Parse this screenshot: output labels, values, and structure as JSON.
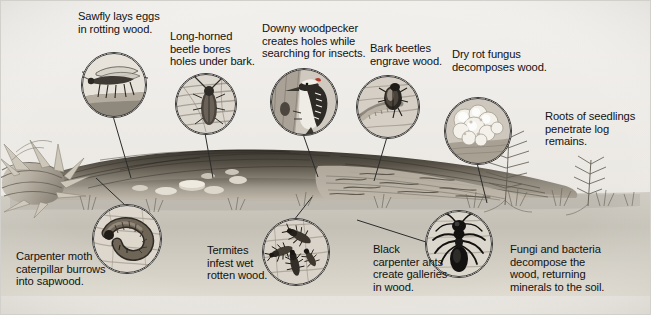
{
  "figure": {
    "background_color": "#f3f3f1",
    "border_color": "#cfcfcb",
    "text_color": "#121212",
    "width": 651,
    "height": 315
  },
  "labels": [
    {
      "id": "sawfly",
      "text": "Sawfly lays eggs\nin rotting wood.",
      "x": 78,
      "y": 10
    },
    {
      "id": "longhorn",
      "text": "Long-horned\nbeetle bores\nholes under bark.",
      "x": 170,
      "y": 30
    },
    {
      "id": "woodpecker",
      "text": "Downy woodpecker\ncreates holes while\nsearching for insects.",
      "x": 262,
      "y": 22
    },
    {
      "id": "barkbeetle",
      "text": "Bark beetles\nengrave wood.",
      "x": 370,
      "y": 42
    },
    {
      "id": "dryrot",
      "text": "Dry rot fungus\ndecomposes wood.",
      "x": 452,
      "y": 48
    },
    {
      "id": "roots",
      "text": "Roots of seedlings\npenetrate log\nremains.",
      "x": 545,
      "y": 110
    },
    {
      "id": "carpentermoth",
      "text": "Carpenter moth\ncaterpillar burrows\ninto sapwood.",
      "x": 16,
      "y": 250
    },
    {
      "id": "termites",
      "text": "Termites\ninfest wet\nrotten wood.",
      "x": 207,
      "y": 244
    },
    {
      "id": "blackants",
      "text": "Black\ncarpenter ants\ncreate galleries\nin wood.",
      "x": 373,
      "y": 243
    },
    {
      "id": "fungibacteria",
      "text": "Fungi and bacteria\ndecompose the\nwood, returning\nminerals to the soil.",
      "x": 510,
      "y": 243
    }
  ],
  "insets": [
    {
      "id": "sawfly-inset",
      "subject": "sawfly",
      "x": 81,
      "y": 52,
      "d": 64
    },
    {
      "id": "longhorn-inset",
      "subject": "long-horned-beetle",
      "x": 175,
      "y": 73,
      "d": 60
    },
    {
      "id": "woodpecker-inset",
      "subject": "downy-woodpecker",
      "x": 270,
      "y": 68,
      "d": 66
    },
    {
      "id": "barkbeetle-inset",
      "subject": "bark-beetle",
      "x": 356,
      "y": 75,
      "d": 62
    },
    {
      "id": "dryrot-inset",
      "subject": "dry-rot-fungus",
      "x": 444,
      "y": 97,
      "d": 66
    },
    {
      "id": "carpentermoth-inset",
      "subject": "carpenter-moth-larva",
      "x": 92,
      "y": 204,
      "d": 68
    },
    {
      "id": "termites-inset",
      "subject": "termites",
      "x": 262,
      "y": 218,
      "d": 66
    },
    {
      "id": "blackants-inset",
      "subject": "black-carpenter-ant",
      "x": 425,
      "y": 210,
      "d": 66
    }
  ],
  "leaders": [
    {
      "id": "leader-sawfly",
      "from": [
        113,
        116
      ],
      "to": [
        131,
        176
      ]
    },
    {
      "id": "leader-longhorn",
      "from": [
        205,
        133
      ],
      "to": [
        213,
        176
      ]
    },
    {
      "id": "leader-woodpecker",
      "from": [
        303,
        134
      ],
      "to": [
        318,
        175
      ]
    },
    {
      "id": "leader-barkbeetle",
      "from": [
        387,
        137
      ],
      "to": [
        374,
        179
      ]
    },
    {
      "id": "leader-dryrot",
      "from": [
        477,
        163
      ],
      "to": [
        486,
        202
      ]
    },
    {
      "id": "leader-carpentermoth",
      "from": [
        126,
        204
      ],
      "to": [
        96,
        176
      ]
    },
    {
      "id": "leader-termites",
      "from": [
        295,
        218
      ],
      "to": [
        310,
        196
      ]
    },
    {
      "id": "leader-blackants",
      "from": [
        425,
        243
      ],
      "to": [
        358,
        220
      ]
    }
  ],
  "scene": {
    "ground_color": "#c9c5bc",
    "sky_color": "#eeece8",
    "log_dark": "#4a453f",
    "log_mid": "#8a8379",
    "log_light": "#b8b2a7",
    "elements": [
      "splintered-log-end-left",
      "fallen-log",
      "bark-surface",
      "shelf-fungi-on-log",
      "soil-line",
      "grass-tufts",
      "fern-seedling",
      "small-conifer-seedling"
    ]
  }
}
